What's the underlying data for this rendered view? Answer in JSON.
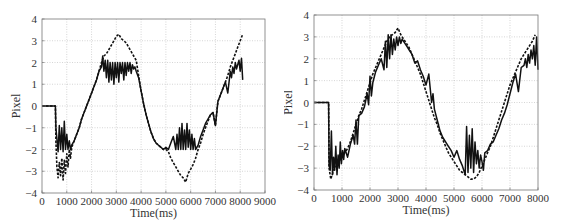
{
  "chart_data": [
    {
      "type": "line",
      "title": "",
      "xlabel": "Time(ms)",
      "ylabel": "Pixel",
      "xlim": [
        0,
        9000
      ],
      "ylim": [
        -4,
        4
      ],
      "xticks": [
        0,
        1000,
        2000,
        3000,
        4000,
        5000,
        6000,
        7000,
        8000,
        9000
      ],
      "yticks": [
        -4,
        -3,
        -2,
        -1,
        0,
        1,
        2,
        3,
        4
      ],
      "grid": true,
      "legend": null,
      "plot_box": {
        "x0": 42,
        "y0": 19,
        "x1": 265,
        "y1": 193
      },
      "series": [
        {
          "name": "solid",
          "style": "solid",
          "x": [
            0,
            540,
            560,
            600,
            650,
            700,
            750,
            800,
            850,
            900,
            950,
            1000,
            1050,
            1100,
            1150,
            1200,
            1300,
            1400,
            1500,
            1600,
            1700,
            1800,
            1900,
            2000,
            2100,
            2200,
            2300,
            2400,
            2450,
            2500,
            2550,
            2600,
            2650,
            2700,
            2750,
            2800,
            2850,
            2900,
            2950,
            3000,
            3050,
            3100,
            3150,
            3200,
            3250,
            3300,
            3350,
            3400,
            3450,
            3500,
            3550,
            3600,
            3650,
            3700,
            3750,
            3800,
            3900,
            4000,
            4100,
            4200,
            4300,
            4400,
            4500,
            4600,
            4700,
            4800,
            4900,
            5000,
            5100,
            5200,
            5300,
            5400,
            5450,
            5500,
            5550,
            5600,
            5650,
            5700,
            5750,
            5800,
            5850,
            5900,
            5950,
            6000,
            6050,
            6100,
            6150,
            6200,
            6300,
            6400,
            6500,
            6600,
            6700,
            6800,
            6900,
            7000,
            7100,
            7200,
            7300,
            7400,
            7500,
            7600,
            7650,
            7700,
            7750,
            7800,
            7850,
            7900,
            7950,
            8000,
            8050,
            8100
          ],
          "y": [
            0,
            0,
            -1.0,
            -1.5,
            -2.1,
            -0.9,
            -2.0,
            -1.0,
            -2.1,
            -0.7,
            -2.0,
            -1.3,
            -2.0,
            -1.6,
            -2.0,
            -1.8,
            -1.6,
            -1.3,
            -1.0,
            -0.6,
            -0.3,
            0.0,
            0.3,
            0.6,
            0.9,
            1.2,
            1.6,
            1.8,
            2.3,
            1.6,
            2.1,
            1.3,
            2.1,
            1.1,
            2.0,
            1.2,
            2.0,
            1.0,
            2.0,
            1.3,
            2.0,
            1.1,
            2.0,
            1.5,
            2.0,
            1.2,
            2.0,
            1.4,
            2.0,
            1.6,
            2.0,
            1.5,
            1.9,
            1.7,
            1.8,
            1.6,
            1.3,
            0.7,
            0.1,
            -0.4,
            -0.8,
            -1.2,
            -1.5,
            -1.7,
            -1.8,
            -1.9,
            -2.0,
            -1.9,
            -2.0,
            -1.7,
            -1.4,
            -2.0,
            -1.3,
            -2.0,
            -1.0,
            -2.0,
            -0.8,
            -2.0,
            -1.1,
            -2.0,
            -0.8,
            -1.9,
            -1.1,
            -2.0,
            -1.3,
            -2.0,
            -1.5,
            -2.0,
            -1.8,
            -1.4,
            -1.1,
            -0.8,
            -0.6,
            -0.4,
            -0.3,
            -0.9,
            0.2,
            0.5,
            0.8,
            1.1,
            0.6,
            1.6,
            1.3,
            1.8,
            1.5,
            2.0,
            1.7,
            1.9,
            2.1,
            1.6,
            2.2,
            1.2
          ],
          "note": "measured trajectory, saturated near ±2 with high-frequency oscillation"
        },
        {
          "name": "dashed",
          "style": "dashed",
          "x": [
            0,
            540,
            560,
            600,
            650,
            700,
            750,
            800,
            850,
            900,
            950,
            1000,
            1050,
            1100,
            1150,
            1200,
            1300,
            1400,
            1500,
            1600,
            1700,
            1800,
            1900,
            2000,
            2100,
            2200,
            2300,
            2400,
            2500,
            2600,
            2700,
            2800,
            2900,
            3000,
            3100,
            3200,
            3300,
            3400,
            3500,
            3600,
            3700,
            3800,
            3900,
            4000,
            4100,
            4200,
            4300,
            4400,
            4500,
            4600,
            4700,
            4800,
            4900,
            5000,
            5100,
            5200,
            5300,
            5400,
            5500,
            5600,
            5700,
            5800,
            5900,
            6000,
            6100,
            6200,
            6300,
            6400,
            6500,
            6600,
            6700,
            6800,
            6900,
            7000,
            7100,
            7200,
            7300,
            7400,
            7500,
            7600,
            7700,
            7800,
            7900,
            8000,
            8100
          ],
          "y": [
            0,
            0,
            -1.6,
            -2.8,
            -3.3,
            -2.6,
            -3.2,
            -2.4,
            -3.4,
            -2.5,
            -3.1,
            -2.2,
            -2.8,
            -2.0,
            -2.4,
            -1.9,
            -1.6,
            -1.3,
            -1.0,
            -0.6,
            -0.3,
            0.0,
            0.3,
            0.6,
            0.9,
            1.2,
            1.6,
            2.0,
            2.3,
            2.4,
            2.6,
            2.8,
            3.0,
            3.2,
            3.3,
            3.1,
            3.0,
            2.9,
            2.7,
            2.5,
            2.3,
            2.1,
            1.4,
            0.7,
            0.1,
            -0.4,
            -0.8,
            -1.2,
            -1.5,
            -1.7,
            -1.8,
            -1.9,
            -2.0,
            -2.0,
            -2.1,
            -2.4,
            -2.6,
            -2.8,
            -3.0,
            -3.2,
            -3.3,
            -3.5,
            -3.1,
            -2.9,
            -2.7,
            -2.4,
            -2.0,
            -1.7,
            -1.3,
            -1.0,
            -0.7,
            -0.4,
            -0.3,
            -0.9,
            0.2,
            0.5,
            0.8,
            1.1,
            1.4,
            1.8,
            2.1,
            2.4,
            2.7,
            3.0,
            3.3
          ],
          "note": "reference trajectory, sinusoid with amplitude ≈ 3.3"
        }
      ]
    },
    {
      "type": "line",
      "title": "",
      "xlabel": "Time(ms)",
      "ylabel": "Pixel",
      "xlim": [
        0,
        8000
      ],
      "ylim": [
        -4,
        4
      ],
      "xticks": [
        0,
        1000,
        2000,
        3000,
        4000,
        5000,
        6000,
        7000,
        8000
      ],
      "yticks": [
        -4,
        -3,
        -2,
        -1,
        0,
        1,
        2,
        3,
        4
      ],
      "grid": true,
      "legend": null,
      "plot_box": {
        "x0": 30,
        "y0": 15,
        "x1": 254,
        "y1": 190
      },
      "series": [
        {
          "name": "solid",
          "style": "solid",
          "x": [
            0,
            520,
            540,
            580,
            620,
            660,
            700,
            740,
            780,
            820,
            860,
            900,
            940,
            980,
            1020,
            1060,
            1100,
            1200,
            1300,
            1400,
            1450,
            1500,
            1550,
            1600,
            1700,
            1800,
            1900,
            1950,
            2000,
            2050,
            2100,
            2200,
            2300,
            2400,
            2500,
            2550,
            2600,
            2650,
            2700,
            2750,
            2800,
            2850,
            2900,
            2950,
            3000,
            3050,
            3100,
            3150,
            3200,
            3300,
            3400,
            3500,
            3600,
            3700,
            3800,
            3900,
            4000,
            4100,
            4200,
            4250,
            4300,
            4400,
            4500,
            4600,
            4700,
            4800,
            4900,
            5000,
            5100,
            5200,
            5300,
            5400,
            5450,
            5500,
            5550,
            5600,
            5650,
            5700,
            5750,
            5800,
            5850,
            5900,
            5950,
            6000,
            6050,
            6100,
            6200,
            6300,
            6400,
            6500,
            6600,
            6700,
            6800,
            6900,
            7000,
            7100,
            7200,
            7300,
            7400,
            7500,
            7550,
            7600,
            7650,
            7700,
            7750,
            7800,
            7850,
            7900,
            7950,
            8000
          ],
          "y": [
            0,
            0,
            -2.9,
            -3.1,
            -1.3,
            -3.3,
            -2.5,
            -3.1,
            -2.0,
            -3.3,
            -2.4,
            -3.0,
            -1.8,
            -2.8,
            -2.2,
            -2.6,
            -2.1,
            -2.5,
            -1.9,
            -1.5,
            -1.9,
            -0.8,
            -1.9,
            -0.6,
            -0.5,
            -0.2,
            0.4,
            -0.1,
            1.2,
            0.3,
            0.9,
            1.4,
            1.7,
            2.0,
            1.5,
            2.8,
            1.6,
            3.1,
            2.0,
            3.1,
            2.2,
            2.9,
            2.4,
            3.0,
            2.6,
            3.0,
            2.7,
            2.9,
            2.8,
            2.6,
            2.4,
            2.2,
            1.8,
            1.9,
            1.5,
            1.2,
            0.8,
            1.3,
            0.0,
            0.4,
            -0.3,
            -0.8,
            -1.3,
            -1.6,
            -1.8,
            -2.0,
            -2.2,
            -2.5,
            -2.2,
            -2.6,
            -2.9,
            -3.3,
            -1.1,
            -3.2,
            -1.5,
            -3.0,
            -1.2,
            -3.2,
            -1.8,
            -2.8,
            -2.2,
            -3.0,
            -2.4,
            -2.7,
            -3.1,
            -2.3,
            -2.2,
            -1.9,
            -1.8,
            -1.5,
            -1.2,
            -0.8,
            -0.5,
            -0.1,
            0.4,
            0.9,
            1.3,
            0.5,
            1.6,
            1.7,
            2.0,
            1.6,
            2.2,
            1.8,
            2.4,
            2.0,
            2.6,
            1.7,
            3.0,
            1.5
          ],
          "note": "measured trajectory, tracks reference closely with oscillation"
        },
        {
          "name": "dashed",
          "style": "dashed",
          "x": [
            0,
            520,
            540,
            600,
            700,
            800,
            900,
            1000,
            1100,
            1200,
            1300,
            1400,
            1500,
            1600,
            1700,
            1800,
            1900,
            2000,
            2100,
            2200,
            2300,
            2400,
            2500,
            2600,
            2700,
            2800,
            2900,
            3000,
            3100,
            3200,
            3300,
            3400,
            3500,
            3600,
            3700,
            3800,
            3900,
            4000,
            4100,
            4200,
            4300,
            4400,
            4500,
            4600,
            4700,
            4800,
            4900,
            5000,
            5100,
            5200,
            5300,
            5400,
            5500,
            5600,
            5700,
            5800,
            5900,
            6000,
            6100,
            6200,
            6300,
            6400,
            6500,
            6600,
            6700,
            6800,
            6900,
            7000,
            7100,
            7200,
            7300,
            7400,
            7500,
            7600,
            7700,
            7800,
            7900,
            8000
          ],
          "y": [
            0,
            0,
            -3.0,
            -3.5,
            -3.1,
            -2.9,
            -2.7,
            -2.4,
            -2.3,
            -2.1,
            -1.8,
            -1.4,
            -1.0,
            -0.6,
            -0.3,
            0.1,
            0.5,
            0.9,
            1.3,
            1.6,
            1.9,
            2.2,
            2.5,
            2.8,
            3.0,
            3.1,
            3.2,
            3.4,
            3.1,
            2.9,
            2.7,
            2.5,
            2.2,
            1.9,
            1.6,
            1.3,
            0.9,
            0.5,
            0.1,
            -0.3,
            -0.7,
            -1.0,
            -1.4,
            -1.7,
            -2.0,
            -2.3,
            -2.5,
            -2.7,
            -2.9,
            -3.1,
            -3.2,
            -3.3,
            -3.4,
            -3.5,
            -3.5,
            -3.4,
            -3.2,
            -2.9,
            -2.6,
            -2.3,
            -2.0,
            -1.6,
            -1.2,
            -0.8,
            -0.4,
            0.0,
            0.4,
            0.8,
            1.1,
            1.4,
            1.7,
            2.0,
            2.2,
            2.4,
            2.6,
            2.8,
            3.1
          ],
          "note": "reference trajectory, sinusoid with amplitude ≈ 3.3"
        }
      ]
    }
  ],
  "charts": [
    {
      "xlabel": "Time(ms)",
      "ylabel": "Pixel"
    },
    {
      "xlabel": "Time(ms)",
      "ylabel": "Pixel"
    }
  ]
}
